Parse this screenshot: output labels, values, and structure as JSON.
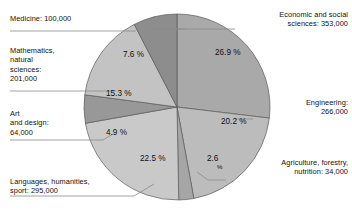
{
  "chart_data": {
    "type": "pie",
    "title": "",
    "subtitle": "",
    "xlabel": "",
    "ylabel": "",
    "legend_position": "callout-labels",
    "grid": false,
    "unit": "students",
    "total": 1313000,
    "categories": [
      "Economic and social sciences",
      "Engineering",
      "Agriculture, forestry, nutrition",
      "Languages, humanities, sport",
      "Art and design",
      "Mathematics, natural sciences",
      "Medicine"
    ],
    "values": [
      353000,
      266000,
      34000,
      295000,
      64000,
      201000,
      100000
    ],
    "percents": [
      26.9,
      20.2,
      2.6,
      22.5,
      4.9,
      15.3,
      7.6
    ],
    "slices": [
      {
        "name": "Economic and social sciences",
        "label_text": "Economic and social\nsciences: 353,000",
        "value_text": "353,000",
        "value": 353000,
        "percent": 26.9,
        "percent_text": "26.9 %",
        "color": "#a9a9a9",
        "start_angle": 0,
        "end_angle": 96.84,
        "label_align": "right",
        "label_x": 240,
        "label_y": 10,
        "label_w": 108,
        "leader_points": "235,29 151,29 185,29",
        "pct_x": 215,
        "pct_y": 55
      },
      {
        "name": "Engineering",
        "label_text": "Engineering:\n266,000",
        "value_text": "266,000",
        "value": 266000,
        "percent": 20.2,
        "percent_text": "20.2 %",
        "color": "#bcbcbc",
        "start_angle": 96.84,
        "end_angle": 169.56,
        "label_align": "right",
        "label_x": 258,
        "label_y": 98,
        "label_w": 90,
        "leader_points": "253,119 235,119",
        "pct_x": 221,
        "pct_y": 124
      },
      {
        "name": "Agriculture, forestry, nutrition",
        "label_text": "Agriculture, forestry,\nnutrition: 34,000",
        "value_text": "34,000",
        "value": 34000,
        "percent": 2.6,
        "percent_text": "2.6",
        "percent_suffix": "%",
        "color": "#a6a6a6",
        "start_angle": 169.56,
        "end_angle": 178.92,
        "label_align": "right",
        "label_x": 231,
        "label_y": 158,
        "label_w": 117,
        "leader_points": "226,180 208,180 197,172",
        "pct_x": 207,
        "pct_y": 161,
        "pct_sub_x": 217,
        "pct_sub_y": 169
      },
      {
        "name": "Languages, humanities, sport",
        "label_text": "Languages, humanities,\nsport: 295,000",
        "value_text": "295,000",
        "value": 295000,
        "percent": 22.5,
        "percent_text": "22.5 %",
        "color": "#c9c9c9",
        "start_angle": 178.92,
        "end_angle": 259.92,
        "label_align": "left",
        "label_x": 10,
        "label_y": 177,
        "label_w": 130,
        "leader_points": "10,196 134,196 154,184",
        "pct_x": 140,
        "pct_y": 161
      },
      {
        "name": "Art and design",
        "label_text": "Art\nand design:\n64,000",
        "value_text": "64,000",
        "value": 64000,
        "percent": 4.9,
        "percent_text": "4.9 %",
        "color": "#989898",
        "start_angle": 259.92,
        "end_angle": 277.56,
        "label_align": "left",
        "label_x": 10,
        "label_y": 109,
        "label_w": 100,
        "leader_points": "10,140 103,140 113,134",
        "pct_x": 106,
        "pct_y": 135
      },
      {
        "name": "Mathematics, natural sciences",
        "label_text": "Mathematics,\nnatural\nsciences:\n201,000",
        "value_text": "201,000",
        "value": 201000,
        "percent": 15.3,
        "percent_text": "15.3 %",
        "color": "#c3c3c3",
        "start_angle": 277.56,
        "end_angle": 332.64,
        "label_align": "left",
        "label_x": 10,
        "label_y": 46,
        "label_w": 100,
        "leader_points": "10,91 101,91 116,91",
        "pct_x": 106,
        "pct_y": 96
      },
      {
        "name": "Medicine",
        "label_text": "Medicine: 100,000",
        "value_text": "100,000",
        "value": 100000,
        "percent": 7.6,
        "percent_text": "7.6 %",
        "color": "#8d8d8d",
        "start_angle": 332.64,
        "end_angle": 360,
        "label_align": "left",
        "label_x": 10,
        "label_y": 14,
        "label_w": 120,
        "leader_points": "10,31 120,31 136,31",
        "pct_x": 123,
        "pct_y": 57
      }
    ],
    "geometry": {
      "center_x": 177,
      "center_y": 107,
      "radius": 93,
      "start_offset_deg": -90
    }
  }
}
